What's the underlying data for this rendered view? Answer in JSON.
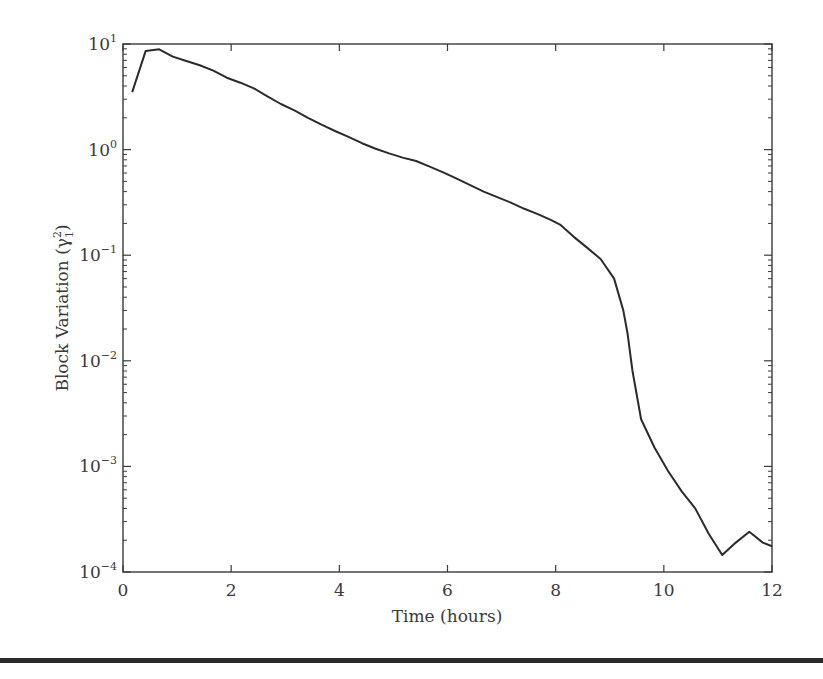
{
  "chart_data": {
    "type": "line",
    "title": "",
    "xlabel": "Time (hours)",
    "ylabel": "Block Variation (γ",
    "ylabel_sup": "2",
    "ylabel_sub": "1",
    "ylabel_close": ")",
    "xscale": "linear",
    "yscale": "log",
    "xlim": [
      0,
      12
    ],
    "ylim": [
      0.0001,
      10
    ],
    "xticks": [
      0,
      2,
      4,
      6,
      8,
      10,
      12
    ],
    "xtick_labels": [
      "0",
      "2",
      "4",
      "6",
      "8",
      "10",
      "12"
    ],
    "yticks": [
      0.0001,
      0.001,
      0.01,
      0.1,
      1,
      10
    ],
    "ytick_labels": [
      {
        "base": "10",
        "exp": "−4"
      },
      {
        "base": "10",
        "exp": "−3"
      },
      {
        "base": "10",
        "exp": "−2"
      },
      {
        "base": "10",
        "exp": "−1"
      },
      {
        "base": "10",
        "exp": "0"
      },
      {
        "base": "10",
        "exp": "1"
      }
    ],
    "grid": false,
    "legend": null,
    "series": [
      {
        "name": "Block Variation",
        "color": "#2b2b2b",
        "x": [
          0.17,
          0.42,
          0.67,
          0.92,
          1.17,
          1.42,
          1.67,
          1.92,
          2.17,
          2.42,
          2.67,
          2.92,
          3.17,
          3.42,
          3.67,
          3.92,
          4.17,
          4.42,
          4.67,
          4.92,
          5.17,
          5.42,
          5.67,
          5.92,
          6.17,
          6.42,
          6.67,
          6.92,
          7.17,
          7.42,
          7.67,
          7.92,
          8.08,
          8.33,
          8.58,
          8.83,
          9.08,
          9.25,
          9.33,
          9.42,
          9.58,
          9.83,
          10.08,
          10.33,
          10.58,
          10.83,
          11.08,
          11.33,
          11.58,
          11.83,
          12.0
        ],
        "values": [
          3.5,
          8.6,
          8.9,
          7.6,
          6.9,
          6.3,
          5.6,
          4.8,
          4.3,
          3.8,
          3.2,
          2.7,
          2.35,
          2.0,
          1.72,
          1.5,
          1.32,
          1.15,
          1.02,
          0.92,
          0.84,
          0.78,
          0.69,
          0.61,
          0.53,
          0.46,
          0.4,
          0.355,
          0.315,
          0.275,
          0.245,
          0.215,
          0.195,
          0.15,
          0.118,
          0.092,
          0.06,
          0.03,
          0.018,
          0.008,
          0.0028,
          0.0015,
          0.0009,
          0.00058,
          0.0004,
          0.00023,
          0.000145,
          0.00019,
          0.00024,
          0.00019,
          0.000175
        ]
      }
    ]
  },
  "axes": {
    "frame_color": "#3a3a3a",
    "plot_area": {
      "left": 123,
      "top": 44,
      "right": 772,
      "bottom": 572
    }
  }
}
